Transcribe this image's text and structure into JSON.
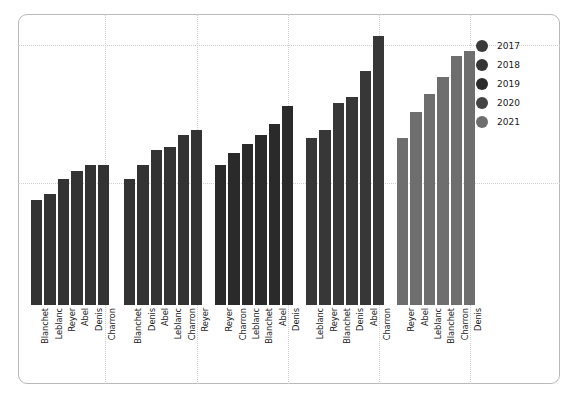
{
  "chart_data": {
    "type": "bar",
    "title": "",
    "xlabel": "",
    "ylabel": "",
    "grid": true,
    "legend_position": "top-right",
    "ylim": [
      0,
      100
    ],
    "categories": [
      "Blanchet",
      "Leblanc",
      "Reyer",
      "Abel",
      "Denis",
      "Charron"
    ],
    "legend": [
      "2017",
      "2018",
      "2019",
      "2020",
      "2021"
    ],
    "series": [
      {
        "name": "2017",
        "color": "#333333",
        "categories": [
          "Blanchet",
          "Leblanc",
          "Reyer",
          "Abel",
          "Denis",
          "Charron"
        ],
        "values": [
          36,
          38,
          43,
          46,
          48,
          48
        ]
      },
      {
        "name": "2018",
        "color": "#333333",
        "categories": [
          "Blanchet",
          "Denis",
          "Abel",
          "Leblanc",
          "Charron",
          "Reyer"
        ],
        "values": [
          43,
          48,
          53,
          54,
          58,
          60
        ]
      },
      {
        "name": "2019",
        "color": "#2a2a2a",
        "categories": [
          "Reyer",
          "Charron",
          "Leblanc",
          "Blanchet",
          "Abel",
          "Denis"
        ],
        "values": [
          48,
          52,
          55,
          58,
          62,
          68
        ]
      },
      {
        "name": "2020",
        "color": "#373737",
        "categories": [
          "Leblanc",
          "Reyer",
          "Blanchet",
          "Denis",
          "Abel",
          "Charron"
        ],
        "values": [
          57,
          60,
          69,
          71,
          80,
          92
        ]
      },
      {
        "name": "2021",
        "color": "#6e6e6e",
        "categories": [
          "Reyer",
          "Abel",
          "Leblanc",
          "Blanchet",
          "Charron",
          "Denis"
        ],
        "values": [
          57,
          66,
          72,
          78,
          85,
          87
        ]
      }
    ],
    "legend_colors": [
      "#3a3a3a",
      "#363636",
      "#2b2b2b",
      "#444444",
      "#6e6e6e"
    ]
  }
}
